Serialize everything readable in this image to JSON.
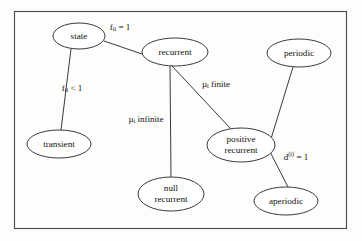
{
  "figure": {
    "background_color": "#fdfdfc",
    "frame_color": "#4a4a4a",
    "stroke_color": "#3a3a3a",
    "text_color": "#111111"
  },
  "nodes": [
    {
      "id": "state",
      "label_line1": "state",
      "label_line2": "",
      "cx": 79,
      "cy": 36,
      "rx": 26,
      "ry": 13
    },
    {
      "id": "recurrent",
      "label_line1": "recurrent",
      "label_line2": "",
      "cx": 175,
      "cy": 52,
      "rx": 33,
      "ry": 14
    },
    {
      "id": "periodic",
      "label_line1": "periodic",
      "label_line2": "",
      "cx": 299,
      "cy": 53,
      "rx": 32,
      "ry": 14
    },
    {
      "id": "transient",
      "label_line1": "transient",
      "label_line2": "",
      "cx": 59,
      "cy": 144,
      "rx": 32,
      "ry": 14
    },
    {
      "id": "null-recurrent",
      "label_line1": "null",
      "label_line2": "recurrent",
      "cx": 171,
      "cy": 194,
      "rx": 33,
      "ry": 17
    },
    {
      "id": "positive-recurrent",
      "label_line1": "positive",
      "label_line2": "recurrent",
      "cx": 241,
      "cy": 145,
      "rx": 34,
      "ry": 17
    },
    {
      "id": "aperiodic",
      "label_line1": "aperiodic",
      "label_line2": "",
      "cx": 286,
      "cy": 201,
      "rx": 32,
      "ry": 14
    }
  ],
  "edges": [
    {
      "id": "state-recurrent",
      "from": "state",
      "to": "recurrent",
      "x1": 104,
      "y1": 41,
      "x2": 145,
      "y2": 55
    },
    {
      "id": "state-transient",
      "from": "state",
      "to": "transient",
      "x1": 71,
      "y1": 49,
      "x2": 61,
      "y2": 130
    },
    {
      "id": "recurrent-null-recurrent",
      "from": "recurrent",
      "to": "null-recurrent",
      "x1": 170,
      "y1": 66,
      "x2": 171,
      "y2": 177
    },
    {
      "id": "recurrent-positive-recurrent",
      "from": "recurrent",
      "to": "positive-recurrent",
      "x1": 172,
      "y1": 66,
      "x2": 231,
      "y2": 129
    },
    {
      "id": "periodic-positive-recurrent",
      "from": "periodic",
      "to": "positive-recurrent",
      "x1": 293,
      "y1": 67,
      "x2": 267,
      "y2": 152
    },
    {
      "id": "positive-recurrent-aperiodic",
      "from": "positive-recurrent",
      "to": "aperiodic",
      "x1": 265,
      "y1": 142,
      "x2": 288,
      "y2": 187
    }
  ],
  "edge_labels": [
    {
      "id": "f-ii-eq-1",
      "base": "f",
      "script": "ii",
      "script_kind": "sub",
      "tail": " = 1",
      "x": 120,
      "y": 28,
      "for_edge": "state-recurrent"
    },
    {
      "id": "f-ii-lt-1",
      "base": "f",
      "script": "ii",
      "script_kind": "sub",
      "tail": " < 1",
      "x": 72,
      "y": 89,
      "for_edge": "state-transient"
    },
    {
      "id": "mu-i-finite",
      "base": "µ",
      "script": "i",
      "script_kind": "sub",
      "tail": " finite",
      "x": 216,
      "y": 85,
      "for_edge": "recurrent-positive-recurrent"
    },
    {
      "id": "mu-i-infinite",
      "base": "µ",
      "script": "i",
      "script_kind": "sub",
      "tail": " infinite",
      "x": 146,
      "y": 120,
      "for_edge": "recurrent-null-recurrent"
    },
    {
      "id": "d-i-eq-1",
      "base": "d",
      "script": "(i)",
      "script_kind": "sup",
      "tail": " = 1",
      "x": 296,
      "y": 158,
      "for_edge": "positive-recurrent-aperiodic"
    }
  ],
  "frame": {
    "x": 14,
    "y": 11,
    "width": 332,
    "height": 217
  }
}
